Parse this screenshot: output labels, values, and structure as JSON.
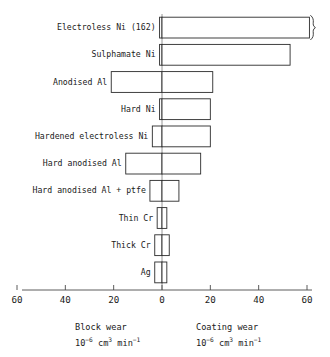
{
  "chart_data": {
    "type": "bar",
    "orientation": "horizontal",
    "style": "diverging-bidirectional",
    "title": "",
    "categories": [
      "Electroless Ni (162)",
      "Sulphamate Ni",
      "Anodised Al",
      "Hard Ni",
      "Hardened electroless Ni",
      "Hard anodised Al + ptfe",
      "Hard anodised Al",
      "Thin Cr",
      "Thick Cr",
      "Ag"
    ],
    "row_order": [
      "Electroless Ni (162)",
      "Sulphamate Ni",
      "Anodised Al",
      "Hard Ni",
      "Hardened electroless Ni",
      "Hard anodised Al",
      "Hard anodised Al + ptfe",
      "Thin Cr",
      "Thick Cr",
      "Ag"
    ],
    "series": [
      {
        "name": "Block wear",
        "side": "left",
        "unit": "10^-6 cm^3 min^-1",
        "values": [
          1,
          1,
          21,
          1,
          4,
          15,
          5,
          2,
          3,
          3
        ]
      },
      {
        "name": "Coating wear",
        "side": "right",
        "unit": "10^-6 cm^3 min^-1",
        "values": [
          162,
          53,
          21,
          20,
          20,
          16,
          7,
          2,
          3,
          2
        ]
      }
    ],
    "axis_broken_rows": [
      "Electroless Ni (162)"
    ],
    "xlabel": "",
    "ylabel": "",
    "xlim": [
      -60,
      60
    ],
    "xticks": [
      -60,
      -40,
      -20,
      0,
      20,
      40,
      60
    ],
    "xtick_labels": [
      "60",
      "40",
      "20",
      "0",
      "20",
      "40",
      "60"
    ],
    "grid": false,
    "legend_position": "below-axis"
  },
  "axis": {
    "tick_labels": [
      "60",
      "40",
      "20",
      "0",
      "20",
      "40",
      "60"
    ]
  },
  "bars": [
    {
      "label": "Electroless Ni (162)",
      "left": 1,
      "right": 162,
      "broken": true
    },
    {
      "label": "Sulphamate Ni",
      "left": 1,
      "right": 53,
      "broken": false
    },
    {
      "label": "Anodised Al",
      "left": 21,
      "right": 21,
      "broken": false
    },
    {
      "label": "Hard Ni",
      "left": 1,
      "right": 20,
      "broken": false
    },
    {
      "label": "Hardened electroless Ni",
      "left": 4,
      "right": 20,
      "broken": false
    },
    {
      "label": "Hard anodised Al",
      "left": 15,
      "right": 16,
      "broken": false
    },
    {
      "label": "Hard anodised Al + ptfe",
      "left": 5,
      "right": 7,
      "broken": false
    },
    {
      "label": "Thin Cr",
      "left": 2,
      "right": 2,
      "broken": false
    },
    {
      "label": "Thick Cr",
      "left": 3,
      "right": 3,
      "broken": false
    },
    {
      "label": "Ag",
      "left": 3,
      "right": 2,
      "broken": false
    }
  ],
  "captions": {
    "left": {
      "name": "Block wear",
      "unit_base": "10",
      "unit_exp": "−6",
      "unit_vol": "cm",
      "unit_vol_exp": "3",
      "unit_time": "min",
      "unit_time_exp": "−1"
    },
    "right": {
      "name": "Coating wear",
      "unit_base": "10",
      "unit_exp": "−6",
      "unit_vol": "cm",
      "unit_vol_exp": "3",
      "unit_time": "min",
      "unit_time_exp": "−1"
    }
  },
  "colors": {
    "background": "#ffffff",
    "bar_stroke": "#2b2b2b",
    "bar_fill": "#ffffff",
    "axis": "#4a4a4a",
    "text": "#1a1a1a"
  }
}
